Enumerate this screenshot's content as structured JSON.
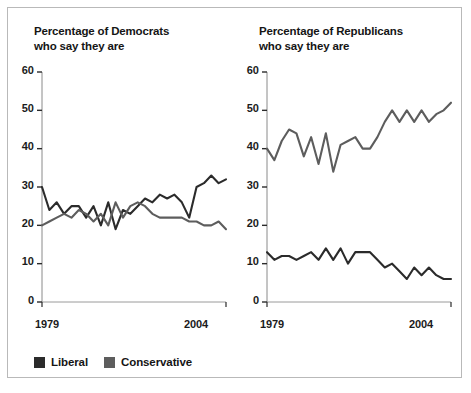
{
  "figure": {
    "background": "#ffffff",
    "border_color": "#b9b9b9"
  },
  "legend": {
    "items": [
      {
        "label": "Liberal",
        "color": "#2b2b2b"
      },
      {
        "label": "Conservative",
        "color": "#5d5d5d"
      }
    ]
  },
  "panels": {
    "democrats": {
      "title_line1": "Percentage of Democrats",
      "title_line2": "who say they are",
      "year_start": "1979",
      "year_end": "2004"
    },
    "republicans": {
      "title_line1": "Percentage of Republicans",
      "title_line2": "who say they are",
      "year_start": "1979",
      "year_end": "2004"
    }
  },
  "chart_data": [
    {
      "id": "democrats",
      "type": "line",
      "title": "Percentage of Democrats who say they are",
      "xlabel": "",
      "ylabel": "",
      "xlim": [
        1979,
        2004
      ],
      "ylim": [
        0,
        60
      ],
      "yticks": [
        0,
        10,
        20,
        30,
        40,
        50,
        60
      ],
      "xticks": [
        1979,
        2004
      ],
      "xticklabels": [
        "1979",
        "2004"
      ],
      "grid": false,
      "legend_position": "below-figure",
      "x": [
        1979,
        1980,
        1981,
        1982,
        1983,
        1984,
        1985,
        1986,
        1987,
        1988,
        1989,
        1990,
        1991,
        1992,
        1993,
        1994,
        1995,
        1996,
        1997,
        1998,
        1999,
        2000,
        2001,
        2002,
        2003,
        2004
      ],
      "series": [
        {
          "name": "Liberal",
          "color": "#2b2b2b",
          "values": [
            30,
            24,
            26,
            23,
            25,
            25,
            22,
            25,
            20,
            26,
            19,
            24,
            23,
            25,
            27,
            26,
            28,
            27,
            28,
            26,
            22,
            30,
            31,
            33,
            31,
            32
          ]
        },
        {
          "name": "Conservative",
          "color": "#5d5d5d",
          "values": [
            20,
            21,
            22,
            23,
            22,
            24,
            23,
            21,
            23,
            20,
            26,
            22,
            25,
            26,
            25,
            23,
            22,
            22,
            22,
            22,
            21,
            21,
            20,
            20,
            21,
            19
          ]
        }
      ]
    },
    {
      "id": "republicans",
      "type": "line",
      "title": "Percentage of Republicans who say they are",
      "xlabel": "",
      "ylabel": "",
      "xlim": [
        1979,
        2004
      ],
      "ylim": [
        0,
        60
      ],
      "yticks": [
        0,
        10,
        20,
        30,
        40,
        50,
        60
      ],
      "xticks": [
        1979,
        2004
      ],
      "xticklabels": [
        "1979",
        "2004"
      ],
      "grid": false,
      "legend_position": "below-figure",
      "x": [
        1979,
        1980,
        1981,
        1982,
        1983,
        1984,
        1985,
        1986,
        1987,
        1988,
        1989,
        1990,
        1991,
        1992,
        1993,
        1994,
        1995,
        1996,
        1997,
        1998,
        1999,
        2000,
        2001,
        2002,
        2003,
        2004
      ],
      "series": [
        {
          "name": "Liberal",
          "color": "#2b2b2b",
          "values": [
            13,
            11,
            12,
            12,
            11,
            12,
            13,
            11,
            14,
            11,
            14,
            10,
            13,
            13,
            13,
            11,
            9,
            10,
            8,
            6,
            9,
            7,
            9,
            7,
            6,
            6
          ]
        },
        {
          "name": "Conservative",
          "color": "#5d5d5d",
          "values": [
            40,
            37,
            42,
            45,
            44,
            38,
            43,
            36,
            44,
            34,
            41,
            42,
            43,
            40,
            40,
            43,
            47,
            50,
            47,
            50,
            47,
            50,
            47,
            49,
            50,
            52
          ]
        }
      ]
    }
  ]
}
